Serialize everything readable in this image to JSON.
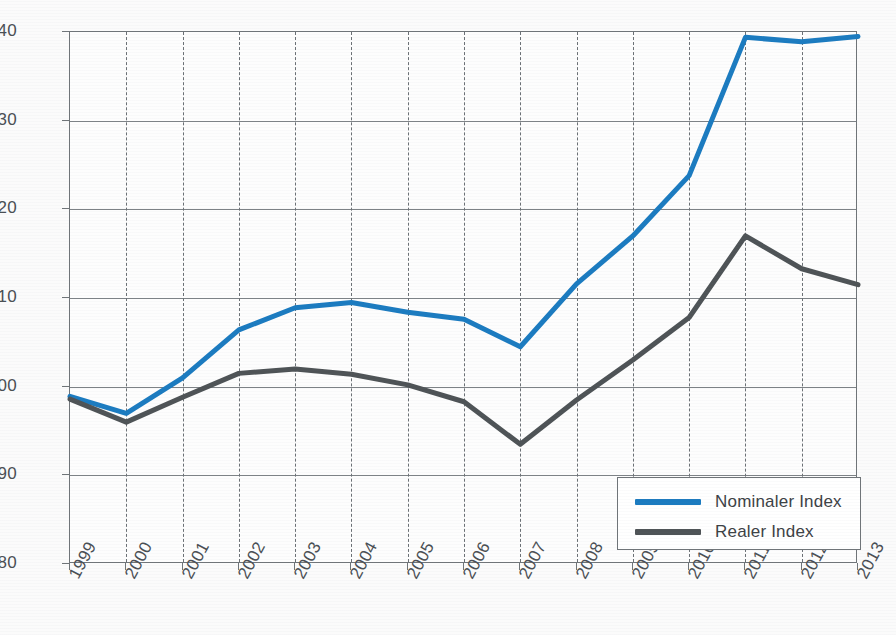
{
  "chart_data": {
    "type": "line",
    "title": "",
    "xlabel": "",
    "ylabel": "",
    "grid": true,
    "legend_position": "bottom-right",
    "x": [
      "1999",
      "2000",
      "2001",
      "2002",
      "2003",
      "2004",
      "2005",
      "2006",
      "2007",
      "2008",
      "2009",
      "2010",
      "2011",
      "2012",
      "2013"
    ],
    "categories": [
      "1999",
      "2000",
      "2001",
      "2002",
      "2003",
      "2004",
      "2005",
      "2006",
      "2007",
      "2008",
      "2009",
      "2010",
      "2011",
      "2012",
      "2013"
    ],
    "xlim": [
      1999,
      2013
    ],
    "ylim": [
      80,
      140
    ],
    "yticks": [
      80,
      90,
      100,
      110,
      120,
      130,
      140
    ],
    "ytick_labels": [
      "80",
      "90",
      "100",
      "110",
      "120",
      "130",
      "140"
    ],
    "series": [
      {
        "name": "Nominaler Index",
        "color": "#1b7bc0",
        "values": [
          98.9,
          97.0,
          101.0,
          106.4,
          108.9,
          109.5,
          108.4,
          107.6,
          104.5,
          111.6,
          117.0,
          123.8,
          139.4,
          138.9,
          139.5
        ]
      },
      {
        "name": "Realer Index",
        "color": "#4e5356",
        "values": [
          98.6,
          96.0,
          98.8,
          101.5,
          102.0,
          101.4,
          100.2,
          98.3,
          93.5,
          98.5,
          103.0,
          107.8,
          117.0,
          113.3,
          111.5
        ]
      }
    ],
    "annotations": {
      "minimum_year_note": "2007",
      "nominal_2007_dip": 104.5,
      "real_2007_dip": 93.5
    }
  },
  "legend": {
    "items": [
      {
        "label": "Nominaler Index",
        "color": "#1b7bc0"
      },
      {
        "label": "Realer Index",
        "color": "#4e5356"
      }
    ]
  },
  "colors": {
    "nominal": "#1b7bc0",
    "real": "#4e5356",
    "axis": "#6f7478",
    "grid": "#7d8286",
    "text": "#4a4f54",
    "background": "#fbfbfb"
  }
}
